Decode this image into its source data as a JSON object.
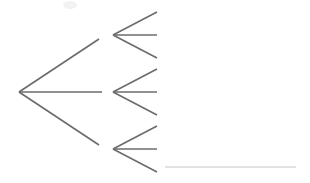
{
  "figure": {
    "title": "",
    "background_color": "#ffffff",
    "width": 310,
    "height": 183
  },
  "style": {
    "edge_color": "#6b6b6b",
    "edge_width": 1.6,
    "faint_edge_color": "#d9d9d9",
    "faint_edge_width": 1.3,
    "smudge_color": "#f2f2f2"
  },
  "chart_data": {
    "type": "diagram",
    "title": "",
    "nodes": [
      {
        "id": "root",
        "label": "",
        "x": 19,
        "y": 92,
        "degree": 3
      },
      {
        "id": "child-top",
        "label": "",
        "x": 113,
        "y": 35,
        "degree": 3
      },
      {
        "id": "child-middle",
        "label": "",
        "x": 113,
        "y": 92,
        "degree": 3
      },
      {
        "id": "child-bottom",
        "label": "",
        "x": 113,
        "y": 149,
        "degree": 3
      }
    ],
    "edges": [
      {
        "id": "root-upper",
        "from": "root",
        "to": "child-top",
        "x1": 19,
        "y1": 92,
        "x2": 99,
        "y2": 39,
        "kind": "solid"
      },
      {
        "id": "root-middle",
        "from": "root",
        "to": "child-middle",
        "x1": 19,
        "y1": 92,
        "x2": 102,
        "y2": 92,
        "kind": "solid"
      },
      {
        "id": "root-lower",
        "from": "root",
        "to": "child-bottom",
        "x1": 19,
        "y1": 92,
        "x2": 99,
        "y2": 145,
        "kind": "solid"
      },
      {
        "id": "top-arm-upper",
        "from": "child-top",
        "to": "leaf-1",
        "x1": 113,
        "y1": 35,
        "x2": 157,
        "y2": 12,
        "kind": "solid"
      },
      {
        "id": "top-arm-middle",
        "from": "child-top",
        "to": "leaf-2",
        "x1": 113,
        "y1": 35,
        "x2": 157,
        "y2": 35,
        "kind": "solid"
      },
      {
        "id": "top-arm-lower",
        "from": "child-top",
        "to": "leaf-3",
        "x1": 113,
        "y1": 35,
        "x2": 157,
        "y2": 58,
        "kind": "solid"
      },
      {
        "id": "middle-arm-upper",
        "from": "child-middle",
        "to": "leaf-4",
        "x1": 113,
        "y1": 92,
        "x2": 157,
        "y2": 69,
        "kind": "solid"
      },
      {
        "id": "middle-arm-middle",
        "from": "child-middle",
        "to": "leaf-5",
        "x1": 113,
        "y1": 92,
        "x2": 157,
        "y2": 92,
        "kind": "solid"
      },
      {
        "id": "middle-arm-lower",
        "from": "child-middle",
        "to": "leaf-6",
        "x1": 113,
        "y1": 92,
        "x2": 157,
        "y2": 115,
        "kind": "solid"
      },
      {
        "id": "bottom-arm-upper",
        "from": "child-bottom",
        "to": "leaf-7",
        "x1": 113,
        "y1": 149,
        "x2": 157,
        "y2": 126,
        "kind": "solid"
      },
      {
        "id": "bottom-arm-middle",
        "from": "child-bottom",
        "to": "leaf-8",
        "x1": 113,
        "y1": 149,
        "x2": 157,
        "y2": 149,
        "kind": "solid"
      },
      {
        "id": "bottom-arm-lower",
        "from": "child-bottom",
        "to": "leaf-9",
        "x1": 113,
        "y1": 149,
        "x2": 157,
        "y2": 172,
        "kind": "solid"
      },
      {
        "id": "baseline-rule",
        "from": "",
        "to": "",
        "x1": 165,
        "y1": 167,
        "x2": 296,
        "y2": 167,
        "kind": "faint"
      }
    ],
    "artifacts": [
      {
        "id": "top-smudge",
        "x": 70,
        "y": 5,
        "rx": 7,
        "ry": 4
      }
    ]
  }
}
